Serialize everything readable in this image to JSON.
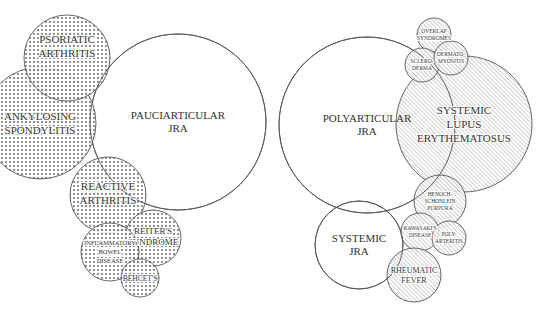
{
  "colors": {
    "stroke": "#555555",
    "text": "#333333",
    "dot": "#444444",
    "hatch": "#777777"
  },
  "groups": {
    "spondyloarthropathies": {
      "pattern": "dots",
      "members": [
        "psoriatic",
        "ankylosing",
        "reactive",
        "reiters",
        "ibd",
        "behcets"
      ]
    },
    "jra": {
      "pattern": "none",
      "members": [
        "pauci",
        "poly",
        "systemic-jra"
      ]
    },
    "vasculitis-ctd": {
      "pattern": "hatch",
      "members": [
        "overlap",
        "sclero",
        "dermato",
        "sle",
        "hsp",
        "kawasaki",
        "polyarteritis",
        "rheumatic"
      ]
    }
  },
  "circles": [
    {
      "id": "pauci",
      "lines": [
        "PAUCIARTICULAR",
        "JRA"
      ],
      "fill": "none",
      "size": "xl"
    },
    {
      "id": "poly",
      "lines": [
        "POLYARTICULAR",
        "JRA"
      ],
      "fill": "none",
      "size": "xl"
    },
    {
      "id": "systemic-jra",
      "lines": [
        "SYSTEMIC",
        "JRA"
      ],
      "fill": "none",
      "size": "l"
    },
    {
      "id": "ankylosing",
      "lines": [
        "ANKYLOSING",
        "SPONDYLITIS"
      ],
      "fill": "dots",
      "size": "l"
    },
    {
      "id": "psoriatic",
      "lines": [
        "PSORIATIC",
        "ARTHRITIS"
      ],
      "fill": "dots",
      "size": "l"
    },
    {
      "id": "reactive",
      "lines": [
        "REACTIVE",
        "ARTHRITIS"
      ],
      "fill": "dots",
      "size": "m"
    },
    {
      "id": "reiters",
      "lines": [
        "REITER'S",
        "SYNDROME"
      ],
      "fill": "dots",
      "size": "s"
    },
    {
      "id": "ibd",
      "lines": [
        "INFLAMMATORY",
        "BOWEL",
        "DISEASE"
      ],
      "fill": "dots",
      "size": "xs"
    },
    {
      "id": "behcets",
      "lines": [
        "BEHCET'S"
      ],
      "fill": "dots",
      "size": "xs"
    },
    {
      "id": "sle",
      "lines": [
        "SYSTEMIC",
        "LUPUS",
        "ERYTHEMATOSUS"
      ],
      "fill": "hatch",
      "size": "l"
    },
    {
      "id": "overlap",
      "lines": [
        "OVERLAP",
        "SYNDROMES"
      ],
      "fill": "hatch",
      "size": "xxs"
    },
    {
      "id": "sclero",
      "lines": [
        "SCLERO-",
        "DERMA"
      ],
      "fill": "hatch",
      "size": "xxs"
    },
    {
      "id": "dermato",
      "lines": [
        "DERMATO-",
        "MYOSITIS"
      ],
      "fill": "hatch",
      "size": "xxs"
    },
    {
      "id": "hsp",
      "lines": [
        "HENOCH-",
        "SCHONLEIN",
        "PURPURA"
      ],
      "fill": "hatch",
      "size": "xxs"
    },
    {
      "id": "kawasaki",
      "lines": [
        "KAWASAKI'S",
        "DISEASE"
      ],
      "fill": "hatch",
      "size": "xxs"
    },
    {
      "id": "polyarteritis",
      "lines": [
        "POLY-",
        "ARTERITIS"
      ],
      "fill": "hatch",
      "size": "xxs"
    },
    {
      "id": "rheumatic",
      "lines": [
        "RHEUMATIC",
        "FEVER"
      ],
      "fill": "hatch",
      "size": "s"
    }
  ]
}
